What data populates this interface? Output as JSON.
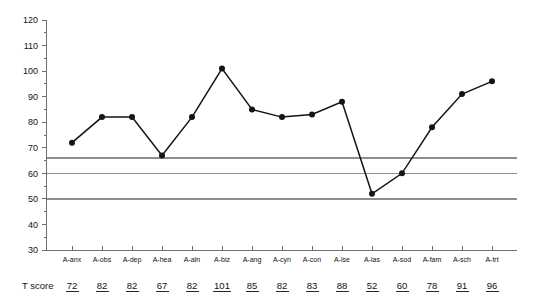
{
  "chart_data": {
    "type": "line",
    "title": "",
    "xlabel": "",
    "ylabel": "",
    "ylim": [
      30,
      120
    ],
    "ytick_values": [
      30,
      40,
      50,
      60,
      70,
      80,
      90,
      100,
      110,
      120
    ],
    "ytick_labels": [
      "30",
      "40",
      "50",
      "60",
      "70",
      "80",
      "90",
      "100",
      "110",
      "120"
    ],
    "grid": false,
    "legend": "none",
    "categories": [
      "A-anx",
      "A-obs",
      "A-dep",
      "A-hea",
      "A-aln",
      "A-biz",
      "A-ang",
      "A-cyn",
      "A-con",
      "A-lse",
      "A-las",
      "A-sod",
      "A-fam",
      "A-sch",
      "A-trt"
    ],
    "values": [
      72,
      82,
      82,
      67,
      82,
      101,
      85,
      82,
      83,
      88,
      52,
      60,
      78,
      91,
      96
    ],
    "series": [
      {
        "name": "T score",
        "values": [
          72,
          82,
          82,
          67,
          82,
          101,
          85,
          82,
          83,
          88,
          52,
          60,
          78,
          91,
          96
        ]
      }
    ],
    "reference_lines": [
      {
        "name": "upper-reference-line",
        "value": 66
      },
      {
        "name": "middle-reference-line",
        "value": 60
      },
      {
        "name": "lower-reference-line",
        "value": 50
      }
    ],
    "annotations": {
      "row_label": "T score",
      "row_values": [
        "72",
        "82",
        "82",
        "67",
        "82",
        "101",
        "85",
        "82",
        "83",
        "88",
        "52",
        "60",
        "78",
        "91",
        "96"
      ]
    },
    "colors": {
      "series": "#141414",
      "reference_line": "#8e8e8e",
      "axis": "#6f6f6f",
      "background": "#ffffff"
    }
  }
}
